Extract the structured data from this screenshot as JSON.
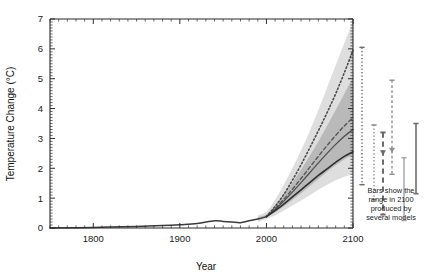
{
  "chart_data": {
    "type": "line",
    "title": "",
    "xlabel": "Year",
    "ylabel": "Temperature Change (°C)",
    "xlim": [
      1750,
      2100
    ],
    "ylim": [
      0,
      7
    ],
    "xticks": [
      1800,
      1900,
      2000,
      2100
    ],
    "xticklabels": [
      "1800",
      "1900",
      "2000",
      "2100"
    ],
    "yticks": [
      0,
      1,
      2,
      3,
      4,
      5,
      6,
      7
    ],
    "yticklabels": [
      "0",
      "1",
      "2",
      "3",
      "4",
      "5",
      "6",
      "7"
    ],
    "minor_ticks": true,
    "grid": false,
    "legend": "none",
    "annotations": [
      {
        "name": "bars-caption",
        "text_lines": [
          "Bars show the",
          "range in 2100",
          "produced by",
          "several models"
        ],
        "x": 2118,
        "y": 1.55
      }
    ],
    "series": [
      {
        "name": "observed-historical",
        "style": "solid",
        "color": "#3a3a3a",
        "width": 1.5,
        "x": [
          1750,
          1800,
          1850,
          1880,
          1900,
          1920,
          1940,
          1950,
          1960,
          1970,
          1980,
          1990,
          2000
        ],
        "values": [
          0.0,
          0.02,
          0.05,
          0.08,
          0.11,
          0.15,
          0.24,
          0.22,
          0.2,
          0.18,
          0.24,
          0.3,
          0.38
        ]
      },
      {
        "name": "scenario-high-dotted",
        "style": "dotted",
        "color": "#4a4a4a",
        "width": 1.6,
        "x": [
          2000,
          2010,
          2020,
          2030,
          2040,
          2050,
          2060,
          2070,
          2080,
          2090,
          2100
        ],
        "values": [
          0.38,
          0.72,
          1.12,
          1.6,
          2.12,
          2.68,
          3.26,
          3.86,
          4.5,
          5.2,
          5.95
        ]
      },
      {
        "name": "scenario-mid-dashed",
        "style": "dashed",
        "color": "#555555",
        "width": 1.4,
        "x": [
          2000,
          2010,
          2020,
          2030,
          2040,
          2050,
          2060,
          2070,
          2080,
          2090,
          2100
        ],
        "values": [
          0.38,
          0.65,
          0.96,
          1.3,
          1.66,
          2.03,
          2.4,
          2.76,
          3.1,
          3.42,
          3.7
        ]
      },
      {
        "name": "scenario-mid-solid",
        "style": "solid",
        "color": "#4f4f4f",
        "width": 1.3,
        "x": [
          2000,
          2010,
          2020,
          2030,
          2040,
          2050,
          2060,
          2070,
          2080,
          2090,
          2100
        ],
        "values": [
          0.38,
          0.62,
          0.9,
          1.2,
          1.52,
          1.85,
          2.18,
          2.5,
          2.8,
          3.07,
          3.3
        ]
      },
      {
        "name": "scenario-low-solid",
        "style": "solid",
        "color": "#2e2e2e",
        "width": 1.6,
        "x": [
          2000,
          2010,
          2020,
          2030,
          2040,
          2050,
          2060,
          2070,
          2080,
          2090,
          2100
        ],
        "values": [
          0.38,
          0.58,
          0.8,
          1.04,
          1.28,
          1.52,
          1.76,
          1.98,
          2.2,
          2.4,
          2.55
        ]
      }
    ],
    "bands": [
      {
        "name": "outer-uncertainty-envelope",
        "fill": "#c9c9c9",
        "x": [
          1990,
          2000,
          2010,
          2020,
          2030,
          2040,
          2050,
          2060,
          2070,
          2080,
          2090,
          2100
        ],
        "upper": [
          0.42,
          0.55,
          0.95,
          1.45,
          2.0,
          2.6,
          3.25,
          3.95,
          4.7,
          5.45,
          6.2,
          6.9
        ],
        "lower": [
          0.2,
          0.3,
          0.42,
          0.58,
          0.75,
          0.92,
          1.1,
          1.28,
          1.45,
          1.6,
          1.72,
          1.8
        ]
      },
      {
        "name": "inner-uncertainty-envelope",
        "fill": "#9a9a9a",
        "x": [
          1990,
          2000,
          2010,
          2020,
          2030,
          2040,
          2050,
          2060,
          2070,
          2080,
          2090,
          2100
        ],
        "upper": [
          0.36,
          0.46,
          0.76,
          1.12,
          1.52,
          1.95,
          2.42,
          2.9,
          3.42,
          3.95,
          4.5,
          5.05
        ],
        "lower": [
          0.26,
          0.36,
          0.52,
          0.72,
          0.94,
          1.16,
          1.4,
          1.64,
          1.88,
          2.1,
          2.3,
          2.45
        ]
      }
    ],
    "error_bars": [
      {
        "name": "model-range-bar-1",
        "x_px": 362,
        "low": 1.45,
        "high": 6.05,
        "style": "dotted",
        "color": "#6d6d6d",
        "width": 1.5,
        "marker": null
      },
      {
        "name": "model-range-bar-2",
        "x_px": 374,
        "low": 0.95,
        "high": 3.45,
        "style": "dotted",
        "color": "#8a8a8a",
        "width": 1.5,
        "marker": null
      },
      {
        "name": "model-range-bar-3",
        "x_px": 383,
        "low": 0.45,
        "high": 3.2,
        "style": "dashed",
        "color": "#6a6a6a",
        "width": 2.0,
        "marker": "triangle-down",
        "marker_value": 2.52
      },
      {
        "name": "model-range-bar-4",
        "x_px": 392,
        "low": 1.8,
        "high": 4.95,
        "style": "dash-small",
        "color": "#8e8e8e",
        "width": 1.4,
        "marker": "triangle-down",
        "marker_value": 2.6
      },
      {
        "name": "model-range-bar-5",
        "x_px": 404,
        "low": 0.25,
        "high": 2.35,
        "style": "solid",
        "color": "#9b9b9b",
        "width": 1.3,
        "marker": null
      },
      {
        "name": "model-range-bar-6",
        "x_px": 416,
        "low": 1.15,
        "high": 3.5,
        "style": "solid",
        "color": "#6f6f6f",
        "width": 1.6,
        "marker": null
      }
    ]
  }
}
